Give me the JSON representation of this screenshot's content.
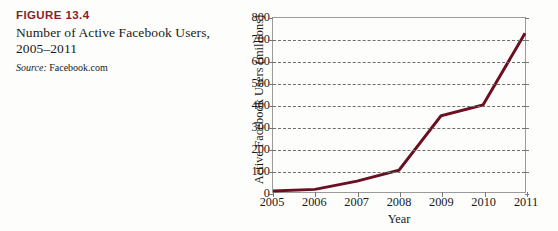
{
  "caption": {
    "figure_number": "FIGURE 13.4",
    "title": "Number of Active Facebook Users, 2005–2011",
    "source_label": "Source:",
    "source_value": " Facebook.com",
    "accent_color": "#8c1d2a"
  },
  "chart_data": {
    "type": "line",
    "title": "Number of Active Facebook Users, 2005–2011",
    "xlabel": "Year",
    "ylabel": "Active Facebook Users (millions)",
    "categories": [
      "2005",
      "2006",
      "2007",
      "2008",
      "2009",
      "2010",
      "2011"
    ],
    "x": [
      2005,
      2006,
      2007,
      2008,
      2009,
      2010,
      2011
    ],
    "values": [
      5,
      12,
      50,
      100,
      350,
      400,
      730
    ],
    "series": [
      {
        "name": "Active Facebook Users",
        "values": [
          5,
          12,
          50,
          100,
          350,
          400,
          730
        ],
        "color": "#6b1020"
      }
    ],
    "ylim": [
      0,
      800
    ],
    "y_ticks": [
      0,
      100,
      200,
      300,
      400,
      500,
      600,
      700,
      800
    ],
    "y_tick_labels": [
      "0",
      "100",
      "200",
      "300",
      "400",
      "500",
      "600",
      "700",
      "800"
    ],
    "xlim": [
      2005,
      2011
    ],
    "grid": "horizontal-dashed",
    "legend": "none",
    "line_color": "#6b1020",
    "line_width": 3,
    "markers": "none"
  }
}
